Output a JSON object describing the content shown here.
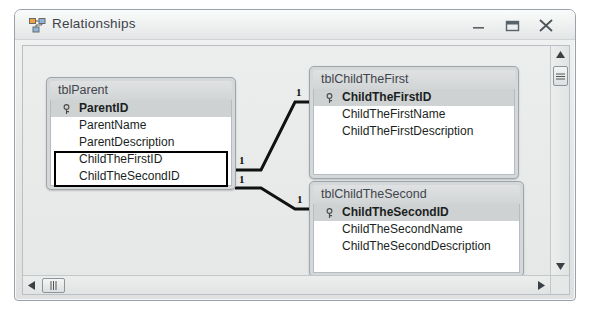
{
  "window": {
    "title": "Relationships",
    "icon": "relationships-icon",
    "controls": {
      "minimize": "minimize-icon",
      "restore": "restore-icon",
      "close": "close-icon"
    }
  },
  "diagram": {
    "tables": [
      {
        "id": "tblParent",
        "title": "tblParent",
        "fields": [
          {
            "name": "ParentID",
            "primary_key": true
          },
          {
            "name": "ParentName",
            "primary_key": false
          },
          {
            "name": "ParentDescription",
            "primary_key": false
          },
          {
            "name": "ChildTheFirstID",
            "primary_key": false
          },
          {
            "name": "ChildTheSecondID",
            "primary_key": false
          }
        ],
        "selected_fields": [
          "ChildTheFirstID",
          "ChildTheSecondID"
        ]
      },
      {
        "id": "tblChildTheFirst",
        "title": "tblChildTheFirst",
        "fields": [
          {
            "name": "ChildTheFirstID",
            "primary_key": true
          },
          {
            "name": "ChildTheFirstName",
            "primary_key": false
          },
          {
            "name": "ChildTheFirstDescription",
            "primary_key": false
          }
        ],
        "selected_fields": []
      },
      {
        "id": "tblChildTheSecond",
        "title": "tblChildTheSecond",
        "fields": [
          {
            "name": "ChildTheSecondID",
            "primary_key": true
          },
          {
            "name": "ChildTheSecondName",
            "primary_key": false
          },
          {
            "name": "ChildTheSecondDescription",
            "primary_key": false
          }
        ],
        "selected_fields": []
      }
    ],
    "relationships": [
      {
        "from_table": "tblParent",
        "from_field": "ChildTheFirstID",
        "to_table": "tblChildTheFirst",
        "to_field": "ChildTheFirstID",
        "from_cardinality": "1",
        "to_cardinality": "1"
      },
      {
        "from_table": "tblParent",
        "from_field": "ChildTheSecondID",
        "to_table": "tblChildTheSecond",
        "to_field": "ChildTheSecondID",
        "from_cardinality": "1",
        "to_cardinality": "1"
      }
    ],
    "cardinality_labels": {
      "rel1_left": "1",
      "rel1_right": "1",
      "rel2_left": "1",
      "rel2_right": "1"
    }
  },
  "scrollbars": {
    "vertical": {
      "up": "scroll-up-icon",
      "down": "scroll-down-icon",
      "thumb": "vertical-scroll-thumb"
    },
    "horizontal": {
      "left": "scroll-left-icon",
      "right": "scroll-right-icon",
      "thumb": "horizontal-scroll-thumb"
    }
  },
  "colors": {
    "frame": "#9aa3ab",
    "titlebar": "#eef0f0",
    "canvas": "#e9eaea",
    "table_header": "#d5d8d9",
    "pk_row": "#cfd2d3",
    "line": "#111111"
  }
}
